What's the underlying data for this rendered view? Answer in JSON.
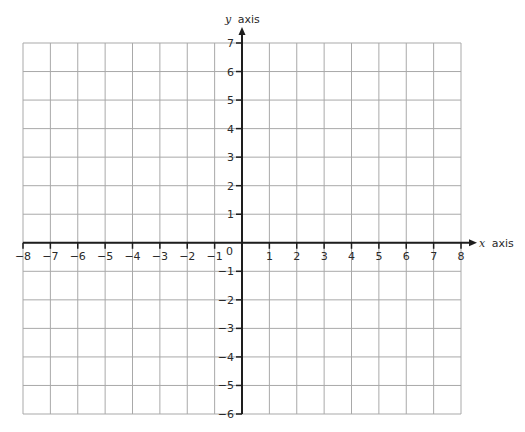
{
  "chart_data": {
    "type": "scatter",
    "title": "",
    "xlabel": "x axis",
    "ylabel": "y axis",
    "xlabel_var": "x",
    "ylabel_var": "y",
    "axis_word": "axis",
    "xlim": [
      -8,
      8
    ],
    "ylim": [
      -6,
      7
    ],
    "x_ticks": [
      -8,
      -7,
      -6,
      -5,
      -4,
      -3,
      -2,
      -1,
      1,
      2,
      3,
      4,
      5,
      6,
      7,
      8
    ],
    "y_ticks": [
      -6,
      -5,
      -4,
      -3,
      -2,
      -1,
      1,
      2,
      3,
      4,
      5,
      6,
      7
    ],
    "origin_label": "0",
    "grid": true,
    "grid_step": 1,
    "series": [],
    "legend": null
  },
  "colors": {
    "grid": "#a9a9a9",
    "axis": "#1e1e1e",
    "text": "#2a2a2a",
    "background": "#ffffff"
  }
}
